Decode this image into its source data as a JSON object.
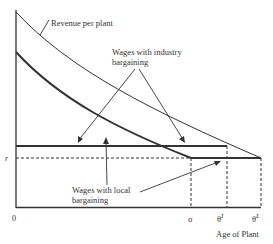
{
  "diagram": {
    "labels": {
      "revenue": "Revenue per plant",
      "industry_line1": "Wages with industry",
      "industry_line2": "bargaining",
      "local_line1": "Wages with local",
      "local_line2": "bargaining",
      "r": "r",
      "origin": "0",
      "sigma": "σ",
      "theta_i": "θ",
      "theta_i_sup": "I",
      "theta_l": "θ",
      "theta_l_sup": "L",
      "x_axis": "Age of Plant"
    },
    "colors": {
      "line": "#333333",
      "background": "#ffffff"
    }
  }
}
